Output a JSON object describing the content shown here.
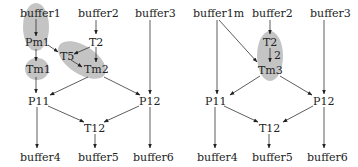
{
  "left_graph": {
    "nodes": {
      "buffer1": "buffer1",
      "buffer2": "buffer2",
      "buffer3": "buffer3",
      "Pm1": "Pm1",
      "T2": "T2",
      "T5": "T5",
      "Tm1": "Tm1",
      "Tm2": "Tm2",
      "P11": "P11",
      "P12": "P12",
      "T12": "T12",
      "buffer4": "buffer4",
      "buffer5": "buffer5",
      "buffer6": "buffer6"
    },
    "groups": [
      "buffer1+Pm1",
      "Tm1",
      "T5+Tm2"
    ]
  },
  "right_graph": {
    "nodes": {
      "buffer1m": "buffer1m",
      "buffer2": "buffer2",
      "buffer3": "buffer3",
      "T2": "T2",
      "Tm3": "Tm3",
      "P11": "P11",
      "P12": "P12",
      "T12": "T12",
      "buffer4": "buffer4",
      "buffer5": "buffer5",
      "buffer6": "buffer6"
    },
    "edge_label": "2",
    "groups": [
      "T2+Tm3"
    ]
  },
  "colors": {
    "group_fill": "#c4c4c4",
    "edge": "#333333",
    "text": "#222222"
  }
}
